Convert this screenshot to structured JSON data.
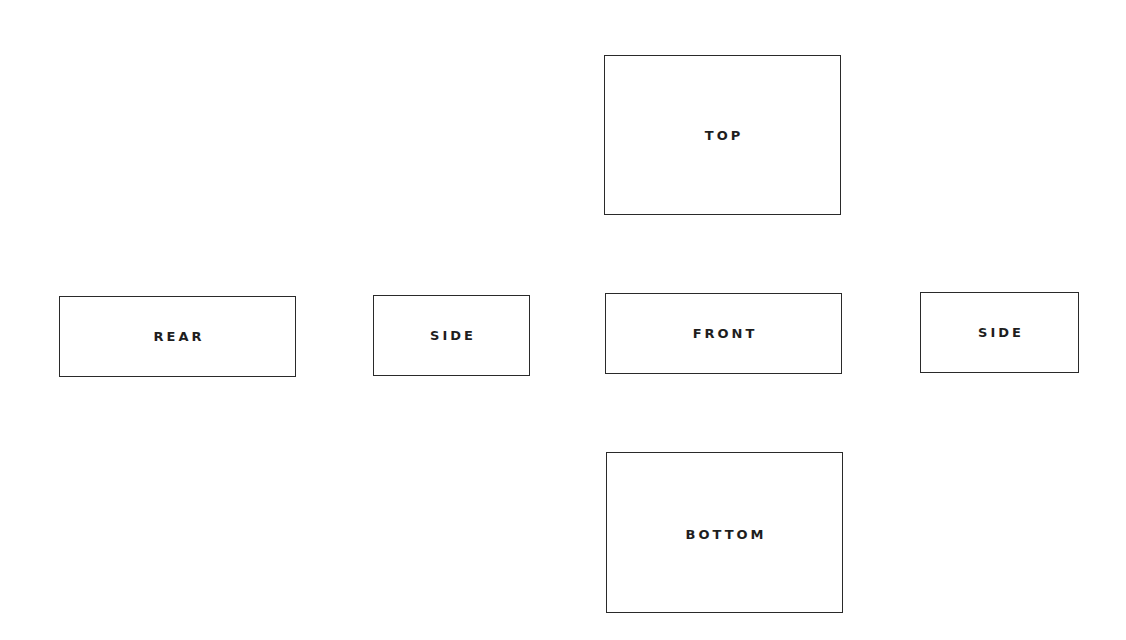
{
  "diagram": {
    "type": "orthographic-view-layout",
    "views": [
      {
        "id": "top",
        "label": "TOP"
      },
      {
        "id": "rear",
        "label": "REAR"
      },
      {
        "id": "side_left",
        "label": "SIDE"
      },
      {
        "id": "front",
        "label": "FRONT"
      },
      {
        "id": "side_right",
        "label": "SIDE"
      },
      {
        "id": "bottom",
        "label": "BOTTOM"
      }
    ],
    "colors": {
      "border": "#2a2a2a",
      "text": "#1e1e1e",
      "background": "#ffffff"
    }
  }
}
